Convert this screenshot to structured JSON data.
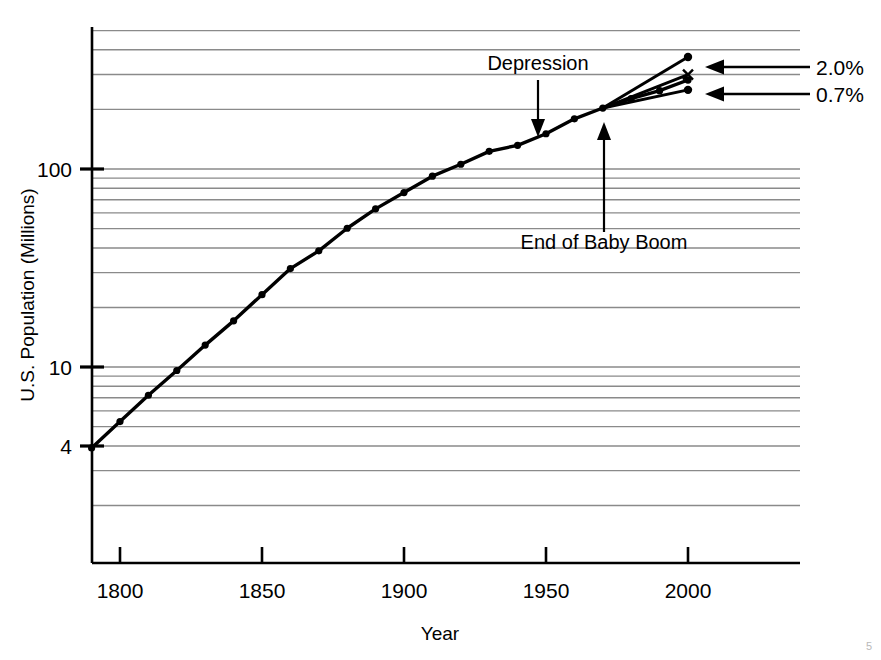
{
  "chart_data": {
    "type": "line",
    "title": "",
    "xlabel": "Year",
    "ylabel": "U.S. Population (Millions)",
    "yscale": "log",
    "ylim": [
      2.4,
      560
    ],
    "xlim": [
      1778,
      2058
    ],
    "grid": true,
    "legend": null,
    "x_ticks": [
      1800,
      1850,
      1900,
      1950,
      2000
    ],
    "x_tick_labels": [
      "1800",
      "1850",
      "1900",
      "1950",
      "2000"
    ],
    "y_ticks": [
      4,
      10,
      100
    ],
    "y_tick_labels": [
      "4",
      "10",
      "100"
    ],
    "y_gridlines": [
      3,
      4,
      5,
      6,
      7,
      8,
      9,
      10,
      20,
      30,
      40,
      50,
      60,
      70,
      80,
      90,
      100,
      200,
      300,
      400,
      500
    ],
    "series": [
      {
        "name": "U.S. Population",
        "marker": "dot",
        "x": [
          1790,
          1800,
          1810,
          1820,
          1830,
          1840,
          1850,
          1860,
          1870,
          1880,
          1890,
          1900,
          1910,
          1920,
          1930,
          1940,
          1950,
          1960,
          1970,
          1980,
          1990,
          2000
        ],
        "values": [
          3.9,
          5.3,
          7.2,
          9.6,
          12.9,
          17.1,
          23.2,
          31.4,
          38.6,
          50.2,
          62.9,
          76.0,
          92.0,
          105.7,
          122.8,
          131.7,
          150.7,
          179.3,
          203.2,
          226.5,
          248.7,
          281.4
        ]
      },
      {
        "name": "Projection at 2.0% growth",
        "marker": "dot",
        "x": [
          1970,
          2000
        ],
        "values": [
          203.2,
          368.0
        ],
        "annotation": "2.0%"
      },
      {
        "name": "Projection at 1.3% growth",
        "marker": "x",
        "x": [
          1970,
          2000
        ],
        "values": [
          203.2,
          300.0
        ],
        "annotation": ""
      },
      {
        "name": "Projection at 0.7% growth",
        "marker": "dot",
        "x": [
          1970,
          2000
        ],
        "values": [
          203.2,
          251.0
        ],
        "annotation": "0.7%"
      }
    ],
    "annotations": [
      {
        "text": "Depression",
        "points_to_year": 1947,
        "points_to_value": 145,
        "direction": "down"
      },
      {
        "text": "End of Baby Boom",
        "points_to_year": 1970,
        "points_to_value": 203,
        "direction": "up"
      },
      {
        "text": "2.0%",
        "arrow": "left",
        "target_year": 2000,
        "target_value": 368
      },
      {
        "text": "0.7%",
        "arrow": "left",
        "target_value": 251,
        "target_year": 2000
      }
    ]
  },
  "axes": {
    "y_title": "U.S. Population (Millions)",
    "x_title": "Year",
    "y_tick_100": "100",
    "y_tick_10": "10",
    "y_tick_4": "4",
    "x_tick_1800": "1800",
    "x_tick_1850": "1850",
    "x_tick_1900": "1900",
    "x_tick_1950": "1950",
    "x_tick_2000": "2000"
  },
  "annotations": {
    "depression": "Depression",
    "baby_boom": "End of Baby Boom",
    "rate_high": "2.0%",
    "rate_low": "0.7%"
  },
  "colors": {
    "line": "#000000",
    "grid": "#8a8a8a",
    "axis": "#000000",
    "background": "#ffffff",
    "text": "#000000"
  },
  "page_mark": "5"
}
